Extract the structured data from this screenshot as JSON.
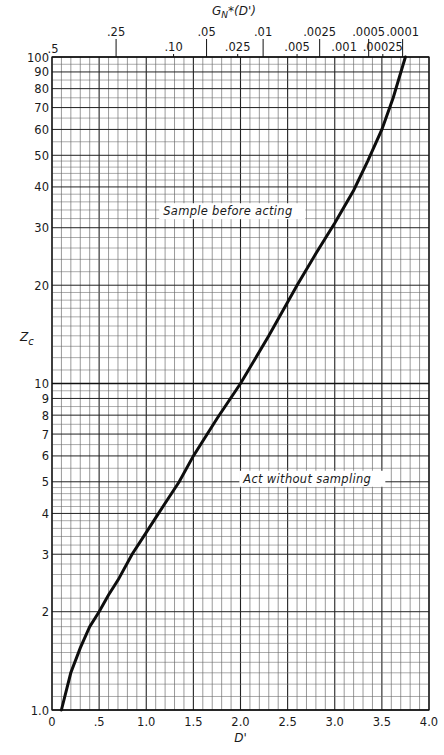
{
  "chart_data": {
    "type": "line",
    "title": "",
    "xlabel": "D'",
    "ylabel": "Z_c",
    "top_axis_label": "G_N*(D')",
    "x_scale": "linear",
    "y_scale": "log",
    "xlim": [
      0,
      4.0
    ],
    "ylim": [
      1.0,
      100
    ],
    "grid": true,
    "x_ticks": [
      "0",
      ".5",
      "1.0",
      "1.5",
      "2.0",
      "2.5",
      "3.0",
      "3.5",
      "4.0"
    ],
    "x_tick_values": [
      0,
      0.5,
      1.0,
      1.5,
      2.0,
      2.5,
      3.0,
      3.5,
      4.0
    ],
    "y_ticks": [
      "1.0",
      "2",
      "3",
      "4",
      "5",
      "6",
      "7",
      "8",
      "9",
      "10",
      "20",
      "30",
      "40",
      "50",
      "60",
      "70",
      "80",
      "90",
      "100"
    ],
    "y_tick_values": [
      1,
      2,
      3,
      4,
      5,
      6,
      7,
      8,
      9,
      10,
      20,
      30,
      40,
      50,
      60,
      70,
      80,
      90,
      100
    ],
    "top_ticks": [
      {
        "label": ".5",
        "d": 0.0,
        "row": 2
      },
      {
        "label": ".25",
        "d": 0.68,
        "row": 0
      },
      {
        "label": ".10",
        "d": 1.29,
        "row": 1
      },
      {
        "label": ".05",
        "d": 1.64,
        "row": 0
      },
      {
        "label": ".025",
        "d": 1.97,
        "row": 1
      },
      {
        "label": ".01",
        "d": 2.24,
        "row": 0
      },
      {
        "label": ".005",
        "d": 2.6,
        "row": 1
      },
      {
        "label": ".0025",
        "d": 2.84,
        "row": 0
      },
      {
        "label": ".001",
        "d": 3.1,
        "row": 1
      },
      {
        "label": ".0005",
        "d": 3.36,
        "row": 0
      },
      {
        "label": ".00025",
        "d": 3.51,
        "row": 1
      },
      {
        "label": ".0001",
        "d": 3.72,
        "row": 0
      }
    ],
    "series": [
      {
        "name": "Z_c boundary",
        "x": [
          0.1,
          0.2,
          0.3,
          0.4,
          0.5,
          0.6,
          0.7,
          0.85,
          1.0,
          1.2,
          1.35,
          1.5,
          1.75,
          2.0,
          2.3,
          2.6,
          2.8,
          3.0,
          3.2,
          3.35,
          3.5,
          3.62,
          3.75
        ],
        "y": [
          1.0,
          1.3,
          1.55,
          1.8,
          2.0,
          2.25,
          2.5,
          3.0,
          3.5,
          4.3,
          5.0,
          6.0,
          7.8,
          10.0,
          14.0,
          20.0,
          25.0,
          31.0,
          39.0,
          48.0,
          60.0,
          75.0,
          100.0
        ]
      }
    ],
    "annotations": [
      {
        "text": "Sample before acting",
        "x": 1.18,
        "y": 33
      },
      {
        "text": "Act without sampling",
        "x": 2.03,
        "y": 5.0
      }
    ]
  }
}
